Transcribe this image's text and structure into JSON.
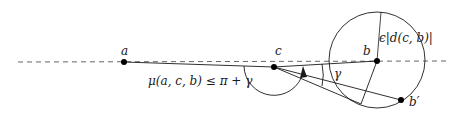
{
  "diagram": {
    "points": {
      "a": {
        "label": "a",
        "x": 124,
        "y": 62
      },
      "c": {
        "label": "c",
        "x": 274,
        "y": 67
      },
      "b": {
        "label": "b",
        "x": 377,
        "y": 61
      },
      "b_prime": {
        "label": "b′",
        "x": 401,
        "y": 100
      }
    },
    "labels": {
      "epsilon_radius": "ϵ|d(c, b)|",
      "angle_bound": "μ(a, c, b) ≤ π + γ",
      "gamma": "γ"
    },
    "colors": {
      "stroke": "#1a1a1a",
      "dash": "#444444"
    }
  }
}
